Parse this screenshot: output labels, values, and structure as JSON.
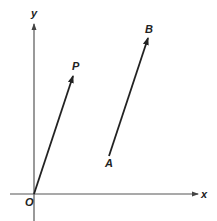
{
  "diagram": {
    "type": "vector-diagram",
    "axes": {
      "x_label": "x",
      "y_label": "y",
      "origin_label": "O"
    },
    "vectors": [
      {
        "name": "OP",
        "from_label": "O",
        "to_label": "P"
      },
      {
        "name": "AB",
        "from_label": "A",
        "to_label": "B"
      }
    ],
    "labels": {
      "P": "P",
      "A": "A",
      "B": "B"
    },
    "colors": {
      "line": "#222222",
      "axis": "#555555",
      "background": "#ffffff"
    }
  }
}
